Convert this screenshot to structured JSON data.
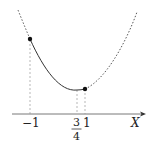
{
  "diagram": {
    "type": "function-graph",
    "axis": {
      "label": "X",
      "has_arrow": true
    },
    "ticks": [
      {
        "id": "minus-one",
        "label": "−1",
        "x_value": -1
      },
      {
        "id": "three-quarters",
        "label_num": "3",
        "label_den": "4",
        "x_value": 0.75
      },
      {
        "id": "one",
        "label": "1",
        "x_value": 1
      }
    ],
    "curve": {
      "shape": "parabola",
      "solid_segment": {
        "from": -1,
        "to": 1
      },
      "dashed_outside": true,
      "minimum_at": 0.75
    },
    "points": [
      {
        "id": "left-endpoint",
        "x_value": -1
      },
      {
        "id": "right-endpoint",
        "x_value": 1
      }
    ],
    "colors": {
      "curve": "#333333",
      "guides": "#999999",
      "axis": "#444444",
      "points": "#111111"
    }
  }
}
